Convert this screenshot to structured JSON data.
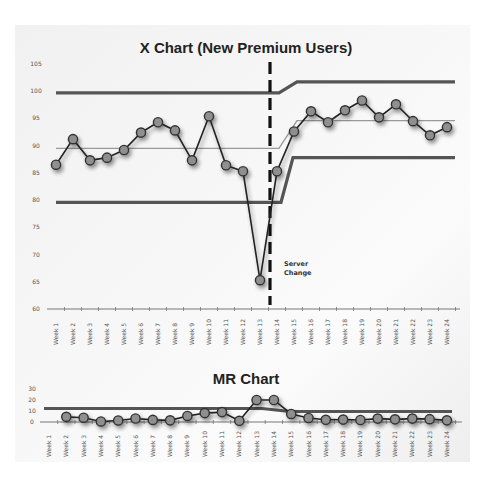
{
  "chart_data": [
    {
      "type": "line",
      "title": "X Chart (New Premium Users)",
      "xlabel": "",
      "ylabel": "",
      "ylim": [
        60,
        105
      ],
      "yticks": [
        60,
        65,
        70,
        75,
        80,
        85,
        90,
        95,
        100,
        105
      ],
      "grid": false,
      "legend": null,
      "categories": [
        "Week 1",
        "Week 2",
        "Week 3",
        "Week 4",
        "Week 5",
        "Week 6",
        "Week 7",
        "Week 8",
        "Week 9",
        "Week 10",
        "Week 11",
        "Week 12",
        "Week 13",
        "Week 14",
        "Week 15",
        "Week 16",
        "Week 17",
        "Week 18",
        "Week 19",
        "Week 20",
        "Week 21",
        "Week 22",
        "Week 23",
        "Week 24"
      ],
      "series": [
        {
          "name": "New Premium Users",
          "values": [
            86.5,
            91.2,
            87.3,
            87.8,
            89.2,
            92.4,
            94.3,
            92.8,
            87.3,
            95.4,
            86.4,
            85.3,
            65.3,
            85.3,
            92.6,
            96.3,
            94.3,
            96.5,
            98.3,
            95.2,
            97.6,
            94.5,
            91.9,
            93.4
          ]
        },
        {
          "name": "UCL",
          "values": [
            99.7,
            99.7,
            99.7,
            99.7,
            99.7,
            99.7,
            99.7,
            99.7,
            99.7,
            99.7,
            99.7,
            99.7,
            99.7,
            99.7,
            101.7,
            101.7,
            101.7,
            101.7,
            101.7,
            101.7,
            101.7,
            101.7,
            101.7,
            101.7
          ]
        },
        {
          "name": "Center Line",
          "values": [
            89.5,
            89.5,
            89.5,
            89.5,
            89.5,
            89.5,
            89.5,
            89.5,
            89.5,
            89.5,
            89.5,
            89.5,
            89.5,
            89.5,
            94.6,
            94.6,
            94.6,
            94.6,
            94.6,
            94.6,
            94.6,
            94.6,
            94.6,
            94.6
          ]
        },
        {
          "name": "LCL",
          "values": [
            79.6,
            79.6,
            79.6,
            79.6,
            79.6,
            79.6,
            79.6,
            79.6,
            79.6,
            79.6,
            79.6,
            79.6,
            79.6,
            79.6,
            87.8,
            87.8,
            87.8,
            87.8,
            87.8,
            87.8,
            87.8,
            87.8,
            87.8,
            87.8
          ]
        }
      ],
      "annotations": [
        {
          "type": "vertical-dashed-line",
          "position": "between Week 13 and Week 14",
          "label": "Server Change"
        }
      ]
    },
    {
      "type": "line",
      "title": "MR Chart",
      "xlabel": "",
      "ylabel": "",
      "ylim": [
        0,
        30
      ],
      "yticks": [
        0,
        10,
        20,
        30
      ],
      "grid": false,
      "legend": null,
      "categories": [
        "Week 1",
        "Week 2",
        "Week 3",
        "Week 4",
        "Week 5",
        "Week 6",
        "Week 7",
        "Week 8",
        "Week 9",
        "Week 10",
        "Week 11",
        "Week 12",
        "Week 13",
        "Week 14",
        "Week 15",
        "Week 16",
        "Week 17",
        "Week 18",
        "Week 19",
        "Week 20",
        "Week 21",
        "Week 22",
        "Week 23",
        "Week 24"
      ],
      "series": [
        {
          "name": "Moving Range",
          "values": [
            null,
            4.7,
            3.9,
            0.5,
            1.4,
            3.2,
            1.9,
            1.5,
            5.5,
            8.1,
            9.0,
            1.1,
            20.0,
            20.0,
            7.3,
            3.7,
            2.0,
            2.2,
            1.8,
            3.1,
            2.4,
            3.1,
            2.6,
            1.5
          ]
        },
        {
          "name": "UCL",
          "values": [
            12.3,
            12.3,
            12.3,
            12.3,
            12.3,
            12.3,
            12.3,
            12.3,
            12.3,
            12.3,
            12.3,
            12.3,
            12.3,
            12.3,
            9.5,
            9.5,
            9.5,
            9.5,
            9.5,
            9.5,
            9.5,
            9.5,
            9.5,
            9.5
          ]
        }
      ]
    }
  ]
}
